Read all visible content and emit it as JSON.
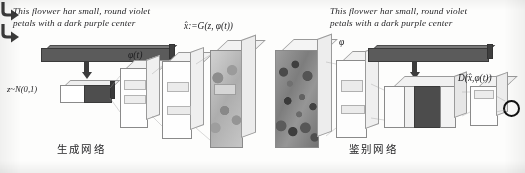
{
  "figure": {
    "type": "gan-architecture-diagram",
    "background_color": "#fdfdfc",
    "ink_color": "#1d1d20"
  },
  "generator": {
    "caption": "This flovwer har small, round violet\npetals with a dark purple center",
    "output_formula": "x̂:=G(z, φ(t))",
    "embedding_label": "φ(t)",
    "noise_label": "z~N(0,1)",
    "section_label": "生成网络",
    "stage_count": 4
  },
  "discriminator": {
    "caption": "This flovwer har small, round violet\npetals with a dark purple center",
    "embedding_symbol": "φ",
    "output_formula": "D(x̂,φ(t))",
    "section_label": "鉴别网络",
    "stage_count": 4
  },
  "icons": {
    "elbow_arrow": "elbow-arrow-icon",
    "down_arrow": "down-arrow-icon",
    "scalar_output": "circle-icon"
  },
  "colors": {
    "text_embedding_bar": "#565656",
    "noise_vector_fill": "#565656",
    "plate_outline": "#8d8d8d",
    "scalar_circle": "#111111"
  }
}
